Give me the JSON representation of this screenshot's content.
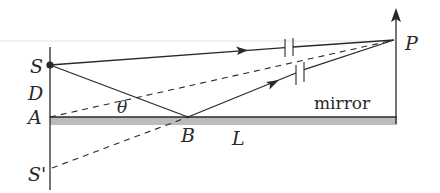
{
  "diagram": {
    "labels": {
      "source": "S",
      "image_source": "S'",
      "screen_point": "P",
      "separation": "D",
      "mirror_edge": "A",
      "reflection_point": "B",
      "length": "L",
      "angle": "θ",
      "mirror": "mirror"
    },
    "elements": [
      {
        "id": "source-S",
        "type": "point",
        "label": "S"
      },
      {
        "id": "image-S-prime",
        "type": "point",
        "label": "S'"
      },
      {
        "id": "screen-P",
        "type": "vertical-axis-with-arrow",
        "label": "P"
      },
      {
        "id": "mirror",
        "type": "reflecting-surface",
        "label": "mirror"
      },
      {
        "id": "direct-ray",
        "from": "S",
        "to": "P",
        "style": "solid",
        "arrow": true,
        "break_marks": true
      },
      {
        "id": "incident-ray",
        "from": "S",
        "to": "B",
        "style": "solid"
      },
      {
        "id": "reflected-ray",
        "from": "B",
        "to": "P",
        "style": "solid",
        "arrow": true,
        "break_marks": true
      },
      {
        "id": "virtual-ray",
        "from": "S'",
        "to": "P",
        "style": "dashed"
      },
      {
        "id": "reference-line",
        "from": "A",
        "to": "P",
        "style": "dashed"
      }
    ],
    "colors": {
      "line": "#2a2a2a",
      "mirror_fill": "#b8b8b8",
      "faint_rule": "#dcdcdc"
    }
  }
}
